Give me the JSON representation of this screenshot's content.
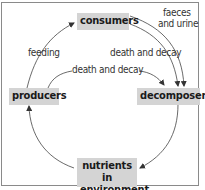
{
  "diagram": {
    "title": "",
    "nodes": {
      "consumers": "consumers",
      "producers": "producers",
      "decomposers": "decomposers",
      "nutrients_line1": "nutrients in",
      "nutrients_line2": "environment"
    },
    "edge_labels": {
      "feeding": "feeding",
      "consumers_death": "death and decay",
      "producers_death": "death and decay",
      "faeces_line1": "faeces",
      "faeces_line2": "and urine"
    },
    "edges": [
      {
        "from": "producers",
        "to": "consumers",
        "label": "feeding"
      },
      {
        "from": "consumers",
        "to": "decomposers",
        "label": "faeces and urine"
      },
      {
        "from": "consumers",
        "to": "decomposers",
        "label": "death and decay"
      },
      {
        "from": "producers",
        "to": "decomposers",
        "label": "death and decay"
      },
      {
        "from": "decomposers",
        "to": "nutrients in environment",
        "label": ""
      },
      {
        "from": "nutrients in environment",
        "to": "producers",
        "label": ""
      }
    ],
    "colors": {
      "node_fill": "#d4d4d4",
      "text": "#1a1a1a",
      "arrow": "#333333",
      "frame": "#8a8a8a"
    }
  }
}
